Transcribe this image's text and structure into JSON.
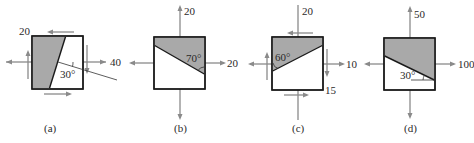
{
  "figure": {
    "panels": [
      {
        "id": "a",
        "caption": "(a)",
        "labels": {
          "normal_x": "40",
          "shear": "20",
          "angle": "30°"
        },
        "plane_angle_deg": 30,
        "description": "Element with normal stress 40 in x and shear 20; inclined plane at 30° below horizontal"
      },
      {
        "id": "b",
        "caption": "(b)",
        "labels": {
          "normal_y": "20",
          "normal_x": "20",
          "angle": "70°"
        },
        "plane_angle_deg": 70,
        "description": "Element with tension 20 in x and y; inclined plane at 70°"
      },
      {
        "id": "c",
        "caption": "(c)",
        "labels": {
          "normal_y": "20",
          "normal_x": "10",
          "shear": "15",
          "angle": "60°"
        },
        "plane_angle_deg": 60,
        "description": "Element with 20 in y, 10 in x and shear 15; inclined plane at 60°"
      },
      {
        "id": "d",
        "caption": "(d)",
        "labels": {
          "normal_y": "50",
          "normal_x": "100",
          "angle": "30°"
        },
        "plane_angle_deg": 30,
        "description": "Element with 50 in y and 100 in x; inclined plane at 30°"
      }
    ],
    "colors": {
      "shade": "#a9a9a9",
      "arrow": "#8a8a8a",
      "outline": "#1a1a1a"
    }
  }
}
